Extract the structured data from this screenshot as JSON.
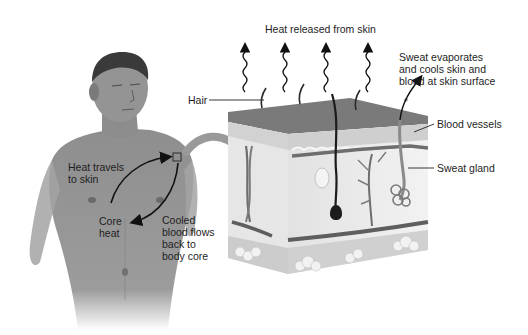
{
  "diagram": {
    "labels": {
      "heat_released": "Heat released from skin",
      "sweat_evaporates": "Sweat evaporates\nand cools skin and\nblood at skin surface",
      "hair": "Hair",
      "blood_vessels": "Blood vessels",
      "sweat_gland": "Sweat gland",
      "heat_travels": "Heat travels\nto skin",
      "core_heat": "Core\nheat",
      "cooled_blood": "Cooled\nblood flows\nback to\nbody core"
    },
    "colors": {
      "epidermis_top": "#7a7a7a",
      "dermis": "#ececec",
      "subcutaneous": "#d4d4d4",
      "vessel": "#6e6e6e",
      "hair": "#1c1c1c",
      "skin_body": "#9a9a9a",
      "arrow": "#111111"
    }
  }
}
